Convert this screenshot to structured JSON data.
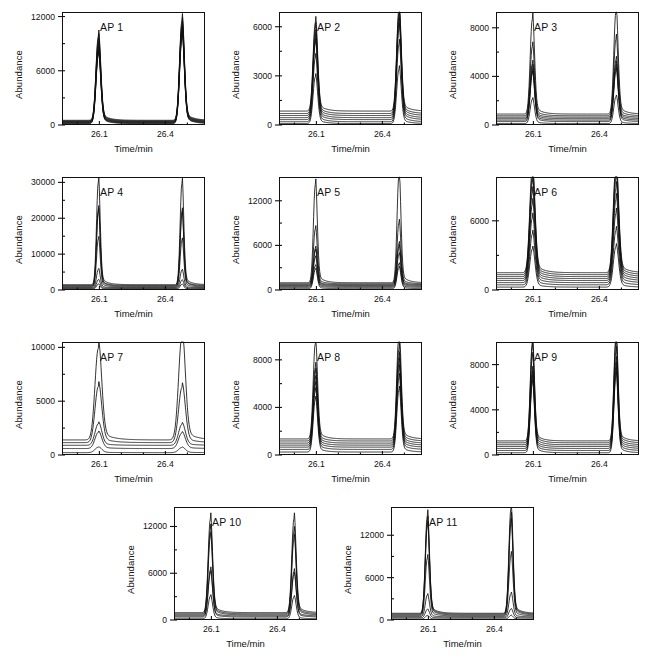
{
  "figure": {
    "axis_label_y": "Abundance",
    "axis_label_x": "Time/min",
    "x_ticks": [
      "26.1",
      "26.4"
    ],
    "x_range": [
      25.93,
      26.58
    ],
    "x_tick_values": [
      26.1,
      26.4
    ],
    "peak1_center": 26.095,
    "peak2_center": 26.475
  },
  "chart_data": {
    "type": "line",
    "xlabel": "Time/min",
    "ylabel": "Abundance",
    "grid": false,
    "legend": "none",
    "xlim": [
      25.93,
      26.58
    ],
    "x_tick_labels": [
      "26.1",
      "26.4"
    ],
    "panels": [
      {
        "label": "AP 1",
        "ylim": [
          0,
          12500
        ],
        "y_ticks": [
          0,
          6000,
          12000
        ],
        "y_tick_labels": [
          "0",
          "6000",
          "12000"
        ],
        "n_traces": 8,
        "peak1_heights": [
          9300,
          9000,
          8600,
          8300,
          8000,
          7800,
          7600,
          7500
        ],
        "peak2_heights": [
          11000,
          10700,
          10400,
          10100,
          9900,
          9700,
          9500,
          9400
        ],
        "baselines": [
          520,
          460,
          400,
          350,
          300,
          250,
          200,
          150
        ],
        "peak_width": 0.021
      },
      {
        "label": "AP 2",
        "ylim": [
          0,
          6900
        ],
        "y_ticks": [
          0,
          3000,
          6000
        ],
        "y_tick_labels": [
          "0",
          "3000",
          "6000"
        ],
        "n_traces": 7,
        "peak1_heights": [
          5400,
          5200,
          4900,
          4750,
          4600,
          3900,
          2850
        ],
        "peak2_heights": [
          6200,
          6050,
          5900,
          5700,
          5500,
          4700,
          3300
        ],
        "baselines": [
          850,
          700,
          580,
          450,
          330,
          200,
          90
        ],
        "peak_width": 0.02
      },
      {
        "label": "AP 3",
        "ylim": [
          0,
          9300
        ],
        "y_ticks": [
          0,
          4000,
          8000
        ],
        "y_tick_labels": [
          "0",
          "4000",
          "8000"
        ],
        "n_traces": 7,
        "peak1_heights": [
          7800,
          5700,
          4400,
          4200,
          4000,
          3900,
          2000
        ],
        "peak2_heights": [
          8400,
          6300,
          4700,
          4450,
          4300,
          4150,
          2200
        ],
        "baselines": [
          900,
          760,
          640,
          520,
          400,
          280,
          120
        ],
        "peak_width": 0.019
      },
      {
        "label": "AP 4",
        "ylim": [
          0,
          31500
        ],
        "y_ticks": [
          0,
          10000,
          20000,
          30000
        ],
        "y_tick_labels": [
          "0",
          "10000",
          "20000",
          "30000"
        ],
        "n_traces": 7,
        "peak1_heights": [
          28600,
          21200,
          20600,
          13400,
          5100,
          2400,
          1400
        ],
        "peak2_heights": [
          28200,
          20600,
          20000,
          13000,
          4900,
          2300,
          1350
        ],
        "baselines": [
          1500,
          1250,
          1050,
          850,
          650,
          450,
          250
        ],
        "peak_width": 0.016
      },
      {
        "label": "AP 5",
        "ylim": [
          0,
          15200
        ],
        "y_ticks": [
          0,
          6000,
          12000
        ],
        "y_tick_labels": [
          "0",
          "6000",
          "12000"
        ],
        "n_traces": 7,
        "peak1_heights": [
          13200,
          7400,
          4900,
          4650,
          3900,
          2900,
          2600
        ],
        "peak2_heights": [
          14400,
          8200,
          5500,
          5200,
          4300,
          3150,
          2850
        ],
        "baselines": [
          980,
          840,
          720,
          600,
          480,
          350,
          180
        ],
        "peak_width": 0.017
      },
      {
        "label": "AP 6",
        "ylim": [
          0,
          9800
        ],
        "y_ticks": [
          0,
          6000
        ],
        "y_tick_labels": [
          "0",
          "6000"
        ],
        "n_traces": 8,
        "peak1_heights": [
          9000,
          8500,
          8100,
          7400,
          6600,
          5600,
          4400,
          3300
        ],
        "peak2_heights": [
          9500,
          9000,
          8500,
          7800,
          7000,
          6000,
          4700,
          3500
        ],
        "baselines": [
          1500,
          1330,
          1160,
          990,
          820,
          640,
          450,
          250
        ],
        "peak_width": 0.023
      },
      {
        "label": "AP 7",
        "ylim": [
          0,
          10500
        ],
        "y_ticks": [
          0,
          5000,
          10000
        ],
        "y_tick_labels": [
          "0",
          "5000",
          "10000"
        ],
        "n_traces": 5,
        "peak1_heights": [
          8500,
          5200,
          2000,
          1500,
          500
        ],
        "peak2_heights": [
          9600,
          5100,
          1950,
          1450,
          480
        ],
        "baselines": [
          1400,
          1150,
          900,
          600,
          220
        ],
        "peak_width": 0.03
      },
      {
        "label": "AP 8",
        "ylim": [
          0,
          9500
        ],
        "y_ticks": [
          0,
          4000,
          8000
        ],
        "y_tick_labels": [
          "0",
          "4000",
          "8000"
        ],
        "n_traces": 7,
        "peak1_heights": [
          8000,
          6200,
          5900,
          5500,
          5200,
          4900,
          4400
        ],
        "peak2_heights": [
          8900,
          7700,
          7200,
          6900,
          6500,
          6000,
          5200
        ],
        "baselines": [
          1350,
          1180,
          1000,
          830,
          660,
          470,
          250
        ],
        "peak_width": 0.019
      },
      {
        "label": "AP 9",
        "ylim": [
          0,
          10000
        ],
        "y_ticks": [
          0,
          4000,
          8000
        ],
        "y_tick_labels": [
          "0",
          "4000",
          "8000"
        ],
        "n_traces": 7,
        "peak1_heights": [
          8700,
          8400,
          7700,
          6700,
          6500,
          6300,
          6100
        ],
        "peak2_heights": [
          9300,
          8900,
          8200,
          7500,
          7200,
          7000,
          6800
        ],
        "baselines": [
          1250,
          1080,
          910,
          750,
          580,
          400,
          200
        ],
        "peak_width": 0.018
      },
      {
        "label": "AP 10",
        "ylim": [
          0,
          14500
        ],
        "y_ticks": [
          0,
          6000,
          12000
        ],
        "y_tick_labels": [
          "0",
          "6000",
          "12000"
        ],
        "n_traces": 6,
        "peak1_heights": [
          12000,
          10800,
          10000,
          5900,
          5600,
          2900
        ],
        "peak2_heights": [
          12000,
          10500,
          9700,
          5700,
          5400,
          2800
        ],
        "baselines": [
          950,
          800,
          660,
          520,
          380,
          160
        ],
        "peak_width": 0.019
      },
      {
        "label": "AP 11",
        "ylim": [
          0,
          16000
        ],
        "y_ticks": [
          0,
          6000,
          12000
        ],
        "y_tick_labels": [
          "0",
          "6000",
          "12000"
        ],
        "n_traces": 7,
        "peak1_heights": [
          13800,
          13100,
          12500,
          8200,
          3100,
          1200,
          500
        ],
        "peak2_heights": [
          14800,
          13600,
          12900,
          8600,
          3300,
          1250,
          520
        ],
        "baselines": [
          950,
          830,
          700,
          570,
          440,
          300,
          130
        ],
        "peak_width": 0.018
      }
    ]
  }
}
